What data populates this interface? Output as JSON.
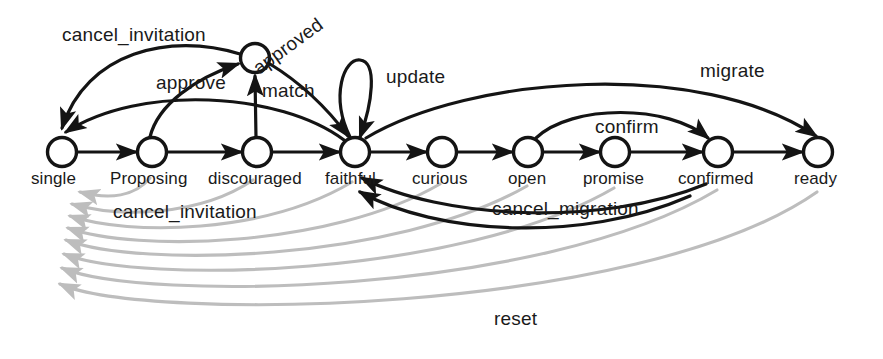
{
  "diagram": {
    "type": "state-transition-graph",
    "colors": {
      "node_stroke": "#141414",
      "node_fill": "#ffffff",
      "edge_primary": "#141414",
      "edge_secondary": "#b9b9b9",
      "text": "#1a1a1a",
      "background": "#ffffff"
    },
    "states": [
      {
        "id": "single",
        "label": "single",
        "x": 62,
        "y": 152
      },
      {
        "id": "proposing",
        "label": "Proposing",
        "x": 152,
        "y": 152
      },
      {
        "id": "discouraged",
        "label": "discouraged",
        "x": 257,
        "y": 152
      },
      {
        "id": "faithful",
        "label": "faithful",
        "x": 355,
        "y": 152
      },
      {
        "id": "curious",
        "label": "curious",
        "x": 442,
        "y": 152
      },
      {
        "id": "open",
        "label": "open",
        "x": 528,
        "y": 152
      },
      {
        "id": "promise",
        "label": "promise",
        "x": 615,
        "y": 152
      },
      {
        "id": "confirmed",
        "label": "confirmed",
        "x": 718,
        "y": 152
      },
      {
        "id": "ready",
        "label": "ready",
        "x": 818,
        "y": 152
      },
      {
        "id": "approved",
        "label": "approved",
        "x": 255,
        "y": 58
      }
    ],
    "transitions": [
      {
        "label": "cancel_invitation",
        "from": "approved",
        "to": "single",
        "style": "dark"
      },
      {
        "label": "approve",
        "from": "proposing",
        "to": "approved",
        "style": "dark"
      },
      {
        "label": "match",
        "from": "discouraged",
        "to": "approved",
        "style": "dark"
      },
      {
        "label": "approved",
        "from": "approved",
        "to": "faithful",
        "style": "dark"
      },
      {
        "label": "update",
        "from": "faithful",
        "to": "faithful",
        "style": "dark"
      },
      {
        "label": "migrate",
        "from": "faithful",
        "to": "ready",
        "style": "dark"
      },
      {
        "label": "confirm",
        "from": "open",
        "to": "confirmed",
        "style": "dark"
      },
      {
        "label": "cancel_invitation",
        "from": "faithful",
        "to": "single",
        "style": "dark"
      },
      {
        "label": "cancel_migration",
        "from": "confirmed",
        "to": "faithful",
        "style": "dark"
      },
      {
        "label": "reset",
        "from": "many",
        "to": "single",
        "style": "light"
      }
    ],
    "edge_labels": [
      {
        "id": "cancel-invitation-top",
        "text": "cancel_invitation",
        "x": 62,
        "y": 24,
        "rotate": 0
      },
      {
        "id": "approved-arc",
        "text": "approved",
        "x": 262,
        "y": 57,
        "rotate": -36
      },
      {
        "id": "approve",
        "text": "approve",
        "x": 156,
        "y": 72,
        "rotate": 0
      },
      {
        "id": "match",
        "text": "match",
        "x": 262,
        "y": 80,
        "rotate": 0
      },
      {
        "id": "update",
        "text": "update",
        "x": 386,
        "y": 66,
        "rotate": 0
      },
      {
        "id": "migrate",
        "text": "migrate",
        "x": 700,
        "y": 60,
        "rotate": 0
      },
      {
        "id": "confirm",
        "text": "confirm",
        "x": 595,
        "y": 116,
        "rotate": 0
      },
      {
        "id": "cancel-invitation-bot",
        "text": "cancel_invitation",
        "x": 113,
        "y": 201,
        "rotate": 0
      },
      {
        "id": "cancel-migration",
        "text": "cancel_migration",
        "x": 492,
        "y": 198,
        "rotate": 0
      },
      {
        "id": "reset",
        "text": "reset",
        "x": 494,
        "y": 308,
        "rotate": 0
      }
    ]
  }
}
